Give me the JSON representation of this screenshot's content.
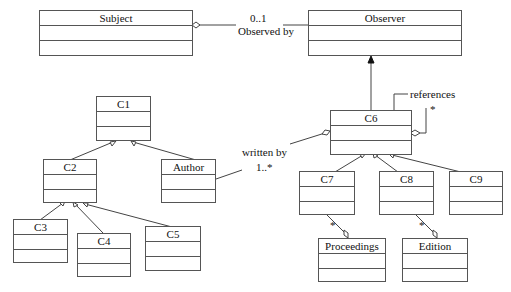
{
  "diagram": {
    "type": "uml-class-diagram",
    "classes": [
      {
        "id": "subject",
        "name": "Subject"
      },
      {
        "id": "observer",
        "name": "Observer"
      },
      {
        "id": "c1",
        "name": "C1"
      },
      {
        "id": "c2",
        "name": "C2"
      },
      {
        "id": "author",
        "name": "Author"
      },
      {
        "id": "c3",
        "name": "C3"
      },
      {
        "id": "c4",
        "name": "C4"
      },
      {
        "id": "c5",
        "name": "C5"
      },
      {
        "id": "c6",
        "name": "C6"
      },
      {
        "id": "c7",
        "name": "C7"
      },
      {
        "id": "c8",
        "name": "C8"
      },
      {
        "id": "c9",
        "name": "C9"
      },
      {
        "id": "proceedings",
        "name": "Proceedings"
      },
      {
        "id": "edition",
        "name": "Edition"
      }
    ],
    "labels": {
      "observed_multiplicity": "0..1",
      "observed_by": "Observed by",
      "written_by": "written by",
      "written_multiplicity": "1..*",
      "references": "references",
      "references_multiplicity": "*",
      "c7_proceedings_multiplicity": "*",
      "c8_edition_multiplicity": "*"
    },
    "relationships": [
      {
        "type": "aggregation",
        "from": "Subject",
        "to": "Observer",
        "label": "Observed by",
        "multiplicity": "0..1"
      },
      {
        "type": "generalization",
        "from": "C6",
        "to": "Observer"
      },
      {
        "type": "generalization",
        "from": "C2",
        "to": "C1"
      },
      {
        "type": "generalization",
        "from": "Author",
        "to": "C1"
      },
      {
        "type": "generalization",
        "from": "C3",
        "to": "C2"
      },
      {
        "type": "generalization",
        "from": "C4",
        "to": "C2"
      },
      {
        "type": "generalization",
        "from": "C5",
        "to": "C2"
      },
      {
        "type": "generalization",
        "from": "C7",
        "to": "C6"
      },
      {
        "type": "generalization",
        "from": "C8",
        "to": "C6"
      },
      {
        "type": "generalization",
        "from": "C9",
        "to": "C6"
      },
      {
        "type": "aggregation",
        "from": "C6",
        "to": "Author",
        "label": "written by",
        "multiplicity": "1..*"
      },
      {
        "type": "aggregation",
        "from": "C6",
        "to": "C6",
        "label": "references",
        "multiplicity": "*"
      },
      {
        "type": "aggregation",
        "from": "Proceedings",
        "to": "C7",
        "multiplicity": "*"
      },
      {
        "type": "aggregation",
        "from": "Edition",
        "to": "C8",
        "multiplicity": "*"
      }
    ]
  }
}
